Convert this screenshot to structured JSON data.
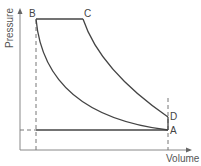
{
  "diagram": {
    "type": "pressure-volume cycle",
    "axes": {
      "y_label": "Pressure",
      "x_label": "Volume"
    },
    "points": {
      "A": "A",
      "B": "B",
      "C": "C",
      "D": "D"
    },
    "colors": {
      "curve": "#444444",
      "axis": "#888888",
      "dashed": "#777777",
      "text": "#444444"
    }
  }
}
